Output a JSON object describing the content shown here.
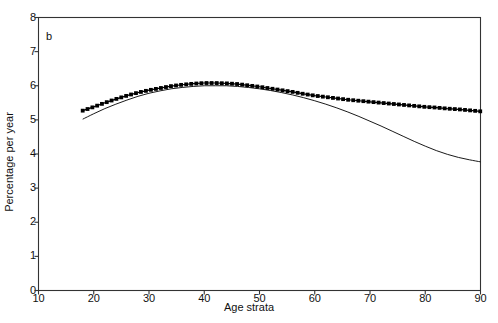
{
  "figure": {
    "panel_label": "b",
    "background_color": "#ffffff",
    "axis_color": "#333333",
    "series_color": "#000000"
  },
  "chart_data": {
    "type": "line",
    "title": "",
    "subtitle": "",
    "panel": "b",
    "xlabel": "Age strata",
    "ylabel": "Percentage per year",
    "xlim": [
      10,
      90
    ],
    "ylim": [
      0,
      8
    ],
    "xticks": [
      10,
      20,
      30,
      40,
      50,
      60,
      70,
      80,
      90
    ],
    "yticks": [
      0,
      1,
      2,
      3,
      4,
      5,
      6,
      7,
      8
    ],
    "xtick_labels": [
      "10",
      "20",
      "30",
      "40",
      "50",
      "60",
      "70",
      "80",
      "90"
    ],
    "ytick_labels": [
      "0",
      "1",
      "2",
      "3",
      "4",
      "5",
      "6",
      "7",
      "8"
    ],
    "grid": false,
    "legend": null,
    "legend_position": "none",
    "annotations": [
      {
        "text": "b",
        "x": 12,
        "y": 7.6
      }
    ],
    "x": [
      18,
      20,
      22,
      24,
      26,
      28,
      30,
      32,
      34,
      36,
      38,
      40,
      42,
      44,
      46,
      48,
      50,
      52,
      54,
      56,
      58,
      60,
      62,
      64,
      66,
      68,
      70,
      72,
      74,
      76,
      78,
      80,
      82,
      84,
      86,
      88,
      90
    ],
    "series": [
      {
        "name": "observed",
        "style": "square-markers",
        "marker": "square",
        "values": [
          5.27,
          5.38,
          5.5,
          5.61,
          5.71,
          5.8,
          5.87,
          5.93,
          5.99,
          6.03,
          6.06,
          6.08,
          6.08,
          6.07,
          6.05,
          6.01,
          5.97,
          5.92,
          5.87,
          5.82,
          5.76,
          5.71,
          5.67,
          5.63,
          5.59,
          5.56,
          5.53,
          5.5,
          5.47,
          5.44,
          5.41,
          5.38,
          5.36,
          5.33,
          5.31,
          5.28,
          5.25
        ]
      },
      {
        "name": "fitted",
        "style": "thin-solid-line",
        "marker": "none",
        "values": [
          5.02,
          5.18,
          5.33,
          5.46,
          5.58,
          5.69,
          5.78,
          5.85,
          5.91,
          5.95,
          5.98,
          6.0,
          6.0,
          6.0,
          5.98,
          5.95,
          5.91,
          5.86,
          5.8,
          5.73,
          5.65,
          5.56,
          5.46,
          5.35,
          5.23,
          5.1,
          4.96,
          4.82,
          4.67,
          4.52,
          4.37,
          4.23,
          4.1,
          3.99,
          3.9,
          3.83,
          3.77
        ]
      }
    ]
  }
}
